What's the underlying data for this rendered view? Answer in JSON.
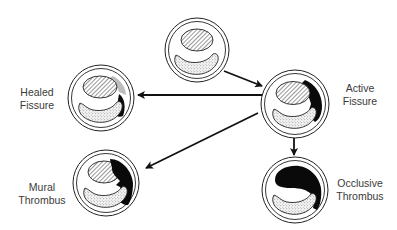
{
  "diagram": {
    "type": "state-transition",
    "colors": {
      "line": "#111111",
      "background": "#ffffff",
      "label_text": "#3a3a3a",
      "thrombus": "#0a0a0a",
      "healed_region": "#bdbdbd"
    },
    "nodes": [
      {
        "id": "normal",
        "label_lines": [],
        "fill": "plaque-intact"
      },
      {
        "id": "active-fissure",
        "label_lines": [
          "Active",
          "Fissure"
        ],
        "fill": "fissure-with-thrombus"
      },
      {
        "id": "healed-fissure",
        "label_lines": [
          "Healed",
          "Fissure"
        ],
        "fill": "healed-fissure"
      },
      {
        "id": "mural-thrombus",
        "label_lines": [
          "Mural",
          "Thrombus"
        ],
        "fill": "mural-thrombus"
      },
      {
        "id": "occlusive-thrombus",
        "label_lines": [
          "Occlusive",
          "Thrombus"
        ],
        "fill": "occlusive-thrombus"
      }
    ],
    "edges": [
      {
        "from": "normal",
        "to": "active-fissure"
      },
      {
        "from": "active-fissure",
        "to": "healed-fissure"
      },
      {
        "from": "active-fissure",
        "to": "mural-thrombus"
      },
      {
        "from": "active-fissure",
        "to": "occlusive-thrombus"
      }
    ],
    "legend_patterns": {
      "hatched": "lipid core",
      "stippled": "lumen"
    }
  }
}
